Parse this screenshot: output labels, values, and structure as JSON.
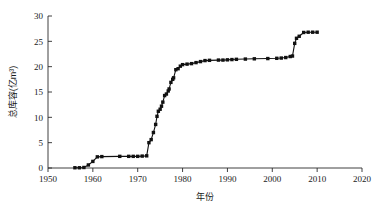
{
  "chart_data": {
    "type": "line",
    "title": "",
    "subtitle": "",
    "xlabel": "年份",
    "ylabel": "总库容(亿m³)",
    "xlim": [
      1950,
      2020
    ],
    "ylim": [
      0,
      30
    ],
    "xticks": [
      1950,
      1960,
      1970,
      1980,
      1990,
      2000,
      2010,
      2020
    ],
    "xtick_labels": [
      "1950",
      "1960",
      "1970",
      "1980",
      "1990",
      "2000",
      "2010",
      "2020"
    ],
    "yticks": [
      0,
      5,
      10,
      15,
      20,
      25,
      30
    ],
    "ytick_labels": [
      "0",
      "5",
      "10",
      "15",
      "20",
      "25",
      "30"
    ],
    "grid": false,
    "legend": false,
    "marker": "filled-square",
    "line_color": "#111111",
    "marker_color": "#111111",
    "series": [
      {
        "name": "总库容",
        "x": [
          1956,
          1957,
          1958,
          1959,
          1960,
          1961,
          1962,
          1966,
          1968,
          1969,
          1970,
          1971,
          1972,
          1972.5,
          1973,
          1973.5,
          1974,
          1974.3,
          1974.6,
          1975,
          1975.3,
          1975.6,
          1976,
          1976.4,
          1976.8,
          1977,
          1977.4,
          1977.8,
          1978,
          1978.5,
          1979,
          1979.5,
          1980,
          1981,
          1982,
          1983,
          1984,
          1985,
          1986,
          1988,
          1989,
          1990,
          1991,
          1992,
          1994,
          1996,
          1999,
          2001,
          2002,
          2003,
          2004,
          2004.5,
          2005,
          2005.4,
          2006,
          2007,
          2008,
          2009,
          2010
        ],
        "y": [
          0.05,
          0.05,
          0.1,
          0.6,
          1.3,
          2.2,
          2.25,
          2.3,
          2.3,
          2.3,
          2.3,
          2.35,
          2.4,
          5.0,
          5.6,
          7.0,
          8.6,
          10.2,
          11.2,
          11.6,
          12.2,
          13.0,
          14.3,
          14.6,
          15.2,
          15.6,
          16.9,
          17.5,
          17.8,
          19.4,
          19.6,
          20.1,
          20.4,
          20.5,
          20.6,
          20.8,
          21.0,
          21.2,
          21.25,
          21.3,
          21.3,
          21.35,
          21.4,
          21.45,
          21.5,
          21.55,
          21.6,
          21.65,
          21.7,
          21.8,
          22.0,
          22.1,
          24.6,
          25.6,
          26.0,
          26.75,
          26.8,
          26.8,
          26.8
        ]
      }
    ]
  }
}
